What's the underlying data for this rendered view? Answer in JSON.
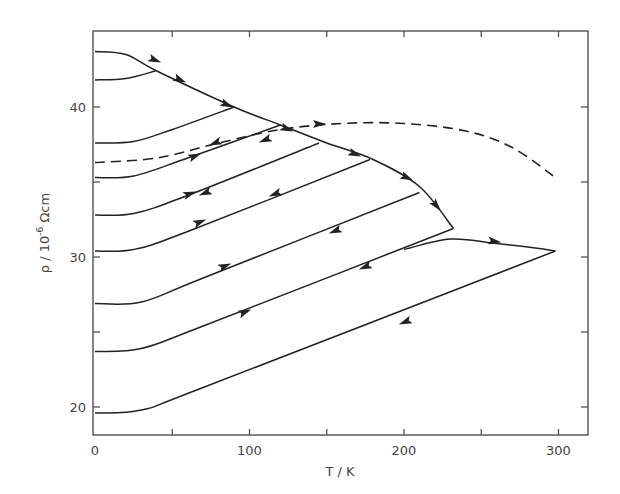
{
  "chart_data": {
    "type": "line",
    "title": "",
    "xlabel": "T / K",
    "ylabel": "ρ / 10⁻⁶ Ωcm",
    "ylabel_parts": {
      "base": "ρ / 10",
      "sup": "-6",
      "unit": " Ωcm"
    },
    "xlim": [
      0,
      320
    ],
    "ylim": [
      18,
      45
    ],
    "xticks": [
      0,
      50,
      100,
      150,
      200,
      250,
      300
    ],
    "xtick_labels": [
      "0",
      "",
      "100",
      "",
      "200",
      "",
      "300"
    ],
    "yticks": [
      20,
      25,
      30,
      35,
      40
    ],
    "ytick_labels": [
      "20",
      "",
      "30",
      "",
      "40"
    ],
    "grid": false,
    "legend": null,
    "series": [
      {
        "name": "envelope (heating)",
        "style": "solid",
        "x": [
          0,
          20,
          40,
          90,
          120,
          150,
          180,
          210,
          232
        ],
        "y": [
          43.7,
          43.5,
          42.4,
          40.0,
          38.8,
          37.6,
          36.5,
          34.7,
          31.9
        ]
      },
      {
        "name": "cycle 1",
        "style": "solid",
        "x": [
          0,
          20,
          39
        ],
        "y": [
          41.8,
          41.9,
          42.4
        ]
      },
      {
        "name": "cycle 2",
        "style": "solid",
        "x": [
          0,
          25,
          50,
          90
        ],
        "y": [
          37.6,
          37.7,
          38.5,
          40.0
        ]
      },
      {
        "name": "cycle 3",
        "style": "solid",
        "x": [
          0,
          25,
          60,
          120
        ],
        "y": [
          35.3,
          35.4,
          36.6,
          38.8
        ]
      },
      {
        "name": "cycle 4",
        "style": "solid",
        "x": [
          0,
          25,
          60,
          145
        ],
        "y": [
          32.8,
          32.9,
          34.1,
          37.6
        ]
      },
      {
        "name": "cycle 5",
        "style": "solid",
        "x": [
          0,
          25,
          60,
          178
        ],
        "y": [
          30.4,
          30.5,
          31.7,
          36.5
        ]
      },
      {
        "name": "cycle 6",
        "style": "solid",
        "x": [
          0,
          30,
          70,
          210
        ],
        "y": [
          26.9,
          27.0,
          28.6,
          34.3
        ]
      },
      {
        "name": "cycle 7",
        "style": "solid",
        "x": [
          0,
          30,
          70,
          232
        ],
        "y": [
          23.7,
          23.9,
          25.4,
          31.9
        ]
      },
      {
        "name": "cycle 8 (to 300 K)",
        "style": "solid",
        "x": [
          200,
          230,
          260,
          285,
          298
        ],
        "y": [
          30.5,
          31.2,
          30.9,
          30.6,
          30.4
        ]
      },
      {
        "name": "cycle 9 (bottom)",
        "style": "solid",
        "x": [
          0,
          30,
          70,
          298
        ],
        "y": [
          19.6,
          19.8,
          21.3,
          30.4
        ]
      },
      {
        "name": "equilibrium (dashed)",
        "style": "dashed",
        "x": [
          0,
          40,
          80,
          120,
          160,
          200,
          240,
          270,
          298
        ],
        "y": [
          36.3,
          36.6,
          37.6,
          38.5,
          38.9,
          38.9,
          38.4,
          37.3,
          35.3
        ]
      }
    ]
  }
}
